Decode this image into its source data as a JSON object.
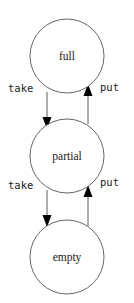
{
  "diagram": {
    "type": "state-transition-diagram",
    "title": "",
    "canvas": {
      "width": 134,
      "height": 303,
      "background": "#ffffff"
    },
    "colors": {
      "node_stroke": "#555555",
      "node_fill": "#ffffff",
      "edge_stroke": "#4a4a4a",
      "arrow_fill": "#000000",
      "text": "#1a1a1a"
    },
    "nodes": [
      {
        "id": "full",
        "label": "full",
        "cx": 67,
        "cy": 56,
        "r": 37
      },
      {
        "id": "partial",
        "label": "partial",
        "cx": 67,
        "cy": 156,
        "r": 37
      },
      {
        "id": "empty",
        "label": "empty",
        "cx": 67,
        "cy": 257,
        "r": 37
      }
    ],
    "edges": [
      {
        "id": "full-to-partial",
        "label": "take",
        "from": "full",
        "to": "partial",
        "direction": "down",
        "x": 47,
        "y_start": 92,
        "y_end": 122,
        "label_x": 8,
        "label_y": 88
      },
      {
        "id": "partial-to-full",
        "label": "put",
        "from": "partial",
        "to": "full",
        "direction": "up",
        "x": 88,
        "y_start": 122,
        "y_end": 89,
        "label_x": 100,
        "label_y": 88
      },
      {
        "id": "partial-to-empty",
        "label": "take",
        "from": "partial",
        "to": "empty",
        "direction": "down",
        "x": 47,
        "y_start": 190,
        "y_end": 224,
        "label_x": 8,
        "label_y": 184
      },
      {
        "id": "empty-to-partial",
        "label": "put",
        "from": "empty",
        "to": "partial",
        "direction": "up",
        "x": 88,
        "y_start": 224,
        "y_end": 189,
        "label_x": 100,
        "label_y": 182
      }
    ]
  }
}
